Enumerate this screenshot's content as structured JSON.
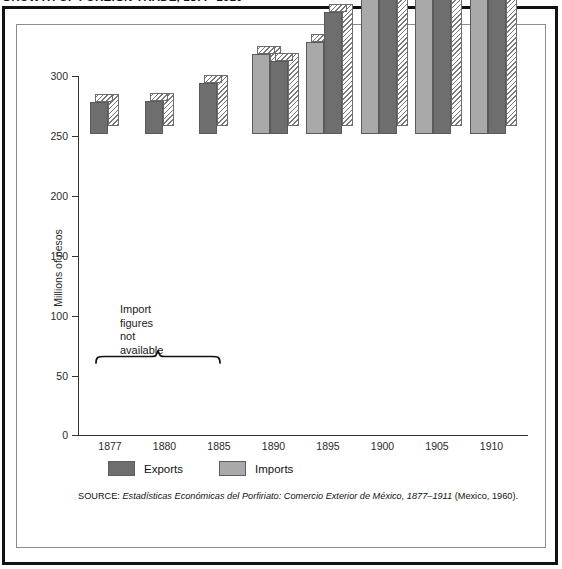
{
  "figure": {
    "title": "GROWTH OF FOREIGN TRADE, 1877–1910"
  },
  "annotation": {
    "line1": "Import",
    "line2": "figures",
    "line3": "not",
    "line4": "available"
  },
  "legend": {
    "items": [
      {
        "label": "Exports",
        "color": "#6e6e6e",
        "name": "legend-exports"
      },
      {
        "label": "Imports",
        "color": "#a9a9a9",
        "name": "legend-imports"
      }
    ]
  },
  "source": {
    "label": "SOURCE: ",
    "title": "Estadísticas Económicas del Porfiriato: Comercio Exterior de México, 1877–1911",
    "suffix": " (Mexico, 1960)."
  },
  "chart_data": {
    "type": "bar",
    "title": "GROWTH OF FOREIGN TRADE, 1877–1910",
    "xlabel": "",
    "ylabel": "Millions of pesos",
    "categories": [
      "1877",
      "1880",
      "1885",
      "1890",
      "1895",
      "1900",
      "1905",
      "1910"
    ],
    "series": [
      {
        "name": "Imports",
        "color": "#a9a9a9",
        "values": [
          null,
          null,
          null,
          67,
          77,
          126,
          178,
          204
        ]
      },
      {
        "name": "Exports",
        "color": "#6e6e6e",
        "values": [
          27,
          28,
          43,
          61,
          102,
          149,
          272,
          284
        ]
      }
    ],
    "ylim": [
      0,
      300
    ],
    "yticks": [
      0,
      50,
      100,
      150,
      200,
      250,
      300
    ],
    "ytick_labels": [
      "0",
      "50",
      "100",
      "150",
      "200",
      "250",
      "300"
    ],
    "grid": false,
    "legend_position": "bottom-left",
    "note": "Import figures not available",
    "note_applies_to": [
      "1877",
      "1880",
      "1885"
    ]
  }
}
